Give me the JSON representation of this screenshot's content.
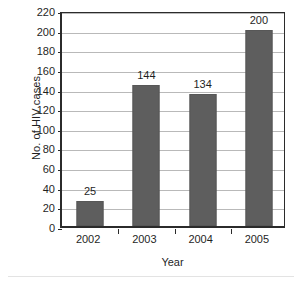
{
  "chart_data": {
    "type": "bar",
    "title": "",
    "xlabel": "Year",
    "ylabel": "No. of HIV cases",
    "categories": [
      "2002",
      "2003",
      "2004",
      "2005"
    ],
    "values": [
      25,
      144,
      134,
      200
    ],
    "data_labels": [
      "25",
      "144",
      "134",
      "200"
    ],
    "ylim": [
      0,
      220
    ],
    "ytick_step": 20,
    "yticks": [
      0,
      20,
      40,
      60,
      80,
      100,
      120,
      140,
      160,
      180,
      200,
      220
    ],
    "ytick_labels": [
      "0",
      "20",
      "40",
      "60",
      "80",
      "100",
      "120",
      "140",
      "160",
      "180",
      "200",
      "220"
    ],
    "grid": "horizontal",
    "legend": "none",
    "series": [
      {
        "name": "No. of HIV cases",
        "values": [
          25,
          144,
          134,
          200
        ]
      }
    ],
    "colors": {
      "bar_fill": "#5e5e5e",
      "bar_border": "#575757",
      "gridline": "#b9b9b9",
      "axis": "#2b2b2b",
      "text": "#1f1f1f",
      "background": "#ffffff"
    }
  }
}
